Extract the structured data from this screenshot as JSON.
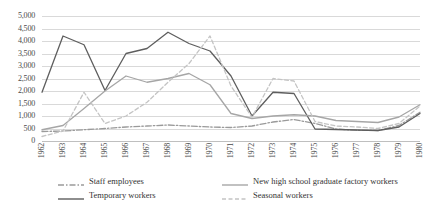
{
  "chart_data": {
    "type": "line",
    "title": "",
    "xlabel": "",
    "ylabel": "",
    "grid": true,
    "legend_position": "bottom",
    "ylim": [
      0,
      5000
    ],
    "ytick_step": 500,
    "ytick_labels": [
      "5,000",
      "4,500",
      "4,000",
      "3,500",
      "3,000",
      "2,500",
      "2,000",
      "1,500",
      "1,000",
      "500",
      "0"
    ],
    "ytick_values": [
      5000,
      4500,
      4000,
      3500,
      3000,
      2500,
      2000,
      1500,
      1000,
      500,
      0
    ],
    "categories": [
      "1962",
      "1963",
      "1964",
      "1965",
      "1966",
      "1967",
      "1968",
      "1969",
      "1970",
      "1971",
      "1972",
      "1973",
      "1974",
      "1975",
      "1976",
      "1977",
      "1978",
      "1979",
      "1980"
    ],
    "series": [
      {
        "name": "Staff employees",
        "style": "dash-dot",
        "color": "#9a9a9a",
        "values": [
          380,
          400,
          450,
          500,
          560,
          600,
          640,
          600,
          560,
          540,
          600,
          760,
          860,
          700,
          480,
          430,
          420,
          620,
          1150
        ]
      },
      {
        "name": "Temporary workers",
        "style": "solid",
        "color": "#5e5e5e",
        "values": [
          1950,
          4200,
          3850,
          2020,
          3500,
          3700,
          4350,
          3900,
          3600,
          2600,
          1000,
          1950,
          1900,
          480,
          460,
          440,
          420,
          560,
          1100
        ]
      },
      {
        "name": "New high school graduate factory workers",
        "style": "solid",
        "color": "#a6a6a6",
        "values": [
          450,
          620,
          1300,
          2000,
          2600,
          2350,
          2500,
          2700,
          2250,
          1100,
          900,
          1000,
          1050,
          1000,
          820,
          780,
          740,
          960,
          1450
        ]
      },
      {
        "name": "Seasonal workers",
        "style": "dashed",
        "color": "#c4c4c4",
        "values": [
          180,
          400,
          1950,
          700,
          1000,
          1550,
          2350,
          3100,
          4200,
          2200,
          950,
          2500,
          2400,
          780,
          600,
          560,
          500,
          700,
          1400
        ]
      }
    ]
  },
  "legend": {
    "entries": [
      {
        "label": "Staff employees"
      },
      {
        "label": "New high school graduate factory workers"
      },
      {
        "label": "Temporary workers"
      },
      {
        "label": "Seasonal workers"
      }
    ]
  }
}
